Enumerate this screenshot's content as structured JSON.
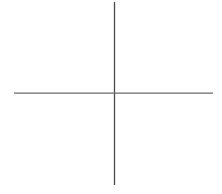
{
  "canvas": {
    "width": 222,
    "height": 194,
    "background_color": "#ffffff",
    "title": "",
    "label_text": ""
  },
  "chart_data": {
    "type": "line",
    "title": "",
    "subtitle": "",
    "xlabel": "",
    "ylabel": "",
    "grid": false,
    "legend": false,
    "legend_position": "none",
    "annotations": [],
    "tick_labels": {
      "x": [],
      "y": []
    },
    "xlim": [
      0,
      222
    ],
    "ylim": [
      0,
      194
    ],
    "series": [
      {
        "name": "vertical-axis",
        "orientation": "vertical",
        "color": "#4a4a4a",
        "stroke_width": 1.3,
        "x": [
          114.5,
          114.5
        ],
        "y": [
          2,
          185
        ],
        "values": [
          2,
          185
        ]
      },
      {
        "name": "horizontal-axis",
        "orientation": "horizontal",
        "color": "#6a6a6a",
        "stroke_width": 1.2,
        "x": [
          14,
          213
        ],
        "y": [
          93.2,
          93.2
        ],
        "values": [
          14,
          213
        ]
      }
    ],
    "intersection": {
      "x": 114.5,
      "y": 93.2
    }
  }
}
